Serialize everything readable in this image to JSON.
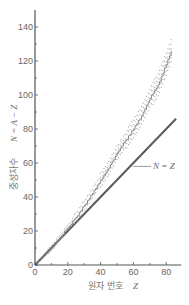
{
  "chart_data": {
    "type": "line",
    "title": "",
    "xlabel": "원자 번호  Z",
    "ylabel": "중성자수  N = A − Z",
    "xlabel_text": "원자 번호",
    "xlabel_var": "Z",
    "ylabel_text": "중성자수",
    "ylabel_var": "N = A − Z",
    "xlim": [
      0,
      88
    ],
    "ylim": [
      0,
      150
    ],
    "xticks": [
      0,
      20,
      40,
      60,
      80
    ],
    "yticks": [
      0,
      20,
      40,
      60,
      80,
      100,
      120,
      140
    ],
    "grid": false,
    "legend": null,
    "annotations": [
      {
        "text": "N = Z",
        "x": 60,
        "y": 58,
        "label_x": 72,
        "label_y": 58
      }
    ],
    "series": [
      {
        "name": "N = Z",
        "style": "solid line",
        "color": "#666666",
        "x": [
          0,
          86
        ],
        "y": [
          0,
          86
        ]
      },
      {
        "name": "stable nuclei (staircase band)",
        "style": "staircase with dots",
        "color": "#888888",
        "x": [
          0,
          5,
          10,
          15,
          20,
          25,
          30,
          35,
          40,
          45,
          50,
          55,
          60,
          65,
          70,
          75,
          80,
          83
        ],
        "y": [
          0,
          5,
          10,
          16,
          22,
          28,
          35,
          42,
          50,
          57,
          66,
          73,
          80,
          88,
          98,
          106,
          118,
          126
        ]
      }
    ]
  }
}
